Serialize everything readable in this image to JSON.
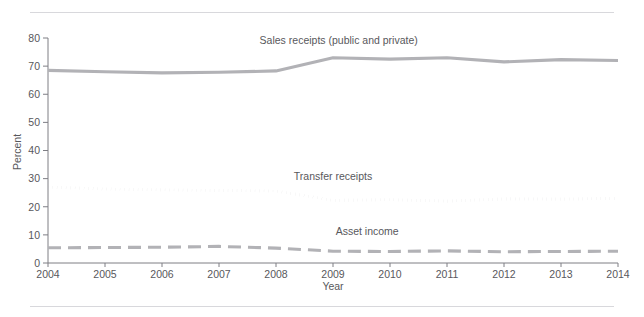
{
  "page": {
    "clipped_header_text": "",
    "background_color": "#ffffff",
    "rule_color": "#d8d8dc"
  },
  "chart_data": {
    "type": "line",
    "title": "",
    "xlabel": "Year",
    "ylabel": "Percent",
    "x": [
      2004,
      2005,
      2006,
      2007,
      2008,
      2009,
      2010,
      2011,
      2012,
      2013,
      2014
    ],
    "xtick_labels": [
      "2004",
      "2005",
      "2006",
      "2007",
      "2008",
      "2009",
      "2010",
      "2011",
      "2012",
      "2013",
      "2014"
    ],
    "ytick_labels": [
      "0",
      "10",
      "20",
      "30",
      "40",
      "50",
      "60",
      "70",
      "80"
    ],
    "yticks": [
      0,
      10,
      20,
      30,
      40,
      50,
      60,
      70,
      80
    ],
    "xlim": [
      2004,
      2014
    ],
    "ylim": [
      0,
      80
    ],
    "grid": false,
    "legend_position": "inline-annotation",
    "series": [
      {
        "name": "Sales receipts (public and private)",
        "style": "solid",
        "color": "#b2b2b6",
        "label_x": 2009.1,
        "label_y": 78,
        "values": [
          68.5,
          68.0,
          67.6,
          67.8,
          68.3,
          73.0,
          72.5,
          73.0,
          71.5,
          72.3,
          72.0
        ]
      },
      {
        "name": "Transfer receipts",
        "style": "dotted",
        "color": "#b2b2b6",
        "label_x": 2009.0,
        "label_y": 29.5,
        "values": [
          27.0,
          26.3,
          26.0,
          25.8,
          25.6,
          22.3,
          22.5,
          22.0,
          22.8,
          22.7,
          23.0
        ]
      },
      {
        "name": "Asset income",
        "style": "dashed",
        "color": "#b2b2b6",
        "label_x": 2009.6,
        "label_y": 10.0,
        "values": [
          5.4,
          5.5,
          5.6,
          5.9,
          5.3,
          4.2,
          4.1,
          4.3,
          4.0,
          4.1,
          4.2
        ]
      }
    ]
  }
}
